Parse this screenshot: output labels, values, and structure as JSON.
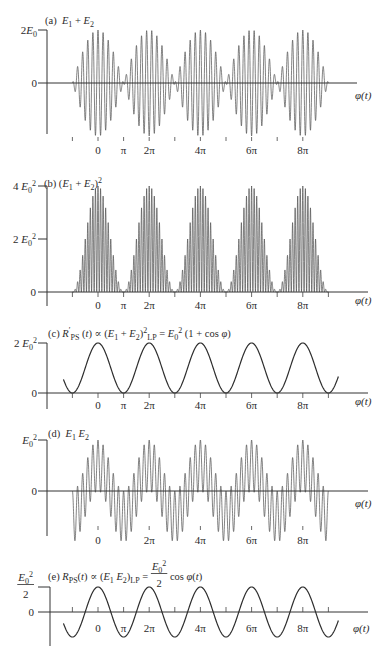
{
  "chart_data": [
    {
      "id": "a",
      "type": "line",
      "title": [
        {
          "text": "(a)  "
        },
        {
          "text": "E",
          "math": true
        },
        {
          "text": "1",
          "sub": true
        },
        {
          "text": " + "
        },
        {
          "text": "E",
          "math": true
        },
        {
          "text": "2",
          "sub": true
        }
      ],
      "xlabel": "φ(t)",
      "x_unit": "π rad",
      "y_unit": "E₀",
      "xlim": [
        -2,
        10.1
      ],
      "ylim": [
        -2,
        2
      ],
      "y_ticks": [
        {
          "value": 2,
          "label": [
            {
              "text": "2"
            },
            {
              "text": "E",
              "math": true
            },
            {
              "text": "0",
              "sub": true
            }
          ]
        },
        {
          "value": 0,
          "label": [
            {
              "text": "0"
            }
          ]
        }
      ],
      "x_tick_marks": [
        -1,
        0,
        1,
        2,
        3,
        4,
        5,
        6,
        7,
        8
      ],
      "x_tick_labels": [
        {
          "value": 0,
          "label": "0"
        },
        {
          "value": 1,
          "label": "π"
        },
        {
          "value": 2,
          "label": "2π"
        },
        {
          "value": 4,
          "label": "4π"
        },
        {
          "value": 6,
          "label": "6π"
        },
        {
          "value": 8,
          "label": "8π"
        }
      ],
      "series": [
        {
          "name": "E1 + E2",
          "model": "beat_sum",
          "amplitude": 2,
          "carrier_cycles_per_2pi": 10,
          "x_range": [
            -1,
            9
          ],
          "envelope_maxima": [
            [
              0,
              2
            ],
            [
              2,
              2
            ],
            [
              4,
              2
            ],
            [
              6,
              2
            ],
            [
              8,
              2
            ]
          ],
          "envelope_zeros": [
            -1,
            1,
            3,
            5,
            7,
            9
          ]
        }
      ]
    },
    {
      "id": "b",
      "type": "line",
      "title": [
        {
          "text": "(b) ("
        },
        {
          "text": "E",
          "math": true
        },
        {
          "text": "1",
          "sub": true
        },
        {
          "text": " + "
        },
        {
          "text": "E",
          "math": true
        },
        {
          "text": "2",
          "sub": true
        },
        {
          "text": ")"
        },
        {
          "text": "2",
          "sup": true
        }
      ],
      "xlabel": "φ(t)",
      "x_unit": "π rad",
      "y_unit": "E₀²",
      "xlim": [
        -2,
        10.5
      ],
      "ylim": [
        0,
        4
      ],
      "y_ticks": [
        {
          "value": 4,
          "label": [
            {
              "text": "4 "
            },
            {
              "text": "E",
              "math": true
            },
            {
              "text": "0",
              "sub": true
            },
            {
              "text": "2",
              "sup": true
            }
          ]
        },
        {
          "value": 2,
          "label": [
            {
              "text": "2 "
            },
            {
              "text": "E",
              "math": true
            },
            {
              "text": "0",
              "sub": true
            },
            {
              "text": "2",
              "sup": true
            }
          ]
        },
        {
          "value": 0,
          "label": [
            {
              "text": "0"
            }
          ]
        }
      ],
      "x_tick_marks": [
        -1,
        0,
        1,
        2,
        3,
        4,
        5,
        6,
        7,
        8,
        9
      ],
      "x_tick_labels": [
        {
          "value": 0,
          "label": "0"
        },
        {
          "value": 1,
          "label": "π"
        },
        {
          "value": 2,
          "label": "2π"
        },
        {
          "value": 4,
          "label": "4π"
        },
        {
          "value": 6,
          "label": "6π"
        },
        {
          "value": 8,
          "label": "8π"
        }
      ],
      "series": [
        {
          "name": "(E1 + E2)^2",
          "model": "beat_sum_squared",
          "amplitude": 4,
          "carrier_cycles_per_2pi": 10,
          "x_range": [
            -1,
            9
          ],
          "peaks": [
            [
              0,
              4
            ],
            [
              2,
              4
            ],
            [
              4,
              4
            ],
            [
              6,
              4
            ],
            [
              8,
              4
            ]
          ],
          "zeros": [
            -1,
            1,
            3,
            5,
            7,
            9
          ]
        }
      ]
    },
    {
      "id": "c",
      "type": "line",
      "title": [
        {
          "text": "(c) "
        },
        {
          "text": "R",
          "math": true
        },
        {
          "text": "′",
          "sup": true
        },
        {
          "text": "PS",
          "sub": true
        },
        {
          "text": " ("
        },
        {
          "text": "t",
          "math": true
        },
        {
          "text": ") ∝ ("
        },
        {
          "text": "E",
          "math": true
        },
        {
          "text": "1",
          "sub": true
        },
        {
          "text": " + "
        },
        {
          "text": "E",
          "math": true
        },
        {
          "text": "2",
          "sub": true
        },
        {
          "text": ")"
        },
        {
          "text": "2",
          "sup": true
        },
        {
          "text": "LP",
          "sub": true
        },
        {
          "text": " = "
        },
        {
          "text": "E",
          "math": true
        },
        {
          "text": "0",
          "sub": true
        },
        {
          "text": "2",
          "sup": true
        },
        {
          "text": " (1 + cos "
        },
        {
          "text": "φ",
          "math": true
        },
        {
          "text": ")"
        }
      ],
      "xlabel": "φ(t)",
      "x_unit": "π rad",
      "y_unit": "E₀²",
      "xlim": [
        -2,
        10.5
      ],
      "ylim": [
        0,
        2
      ],
      "y_ticks": [
        {
          "value": 2,
          "label": [
            {
              "text": "2 "
            },
            {
              "text": "E",
              "math": true
            },
            {
              "text": "0",
              "sub": true
            },
            {
              "text": "2",
              "sup": true
            }
          ]
        },
        {
          "value": 0,
          "label": [
            {
              "text": "0"
            }
          ]
        }
      ],
      "x_tick_marks": [
        -1,
        0,
        1,
        2,
        3,
        4,
        5,
        6,
        7,
        8,
        9
      ],
      "x_tick_labels": [
        {
          "value": 0,
          "label": "0"
        },
        {
          "value": 1,
          "label": "π"
        },
        {
          "value": 2,
          "label": "2π"
        },
        {
          "value": 4,
          "label": "4π"
        },
        {
          "value": 6,
          "label": "6π"
        },
        {
          "value": 8,
          "label": "8π"
        }
      ],
      "series": [
        {
          "name": "R'PS(t)",
          "model": "one_plus_cos",
          "amplitude": 1,
          "x_range": [
            -1.35,
            9.4
          ],
          "points": [
            [
              -1,
              0
            ],
            [
              0,
              2
            ],
            [
              1,
              0
            ],
            [
              2,
              2
            ],
            [
              3,
              0
            ],
            [
              4,
              2
            ],
            [
              5,
              0
            ],
            [
              6,
              2
            ],
            [
              7,
              0
            ],
            [
              8,
              2
            ],
            [
              9,
              0
            ]
          ]
        }
      ]
    },
    {
      "id": "d",
      "type": "line",
      "title": [
        {
          "text": "(d)  "
        },
        {
          "text": "E",
          "math": true
        },
        {
          "text": "1",
          "sub": true
        },
        {
          "text": " "
        },
        {
          "text": "E",
          "math": true
        },
        {
          "text": "2",
          "sub": true
        }
      ],
      "xlabel": "φ(t)",
      "x_unit": "π rad",
      "y_unit": "E₀²",
      "xlim": [
        -2,
        10.5
      ],
      "ylim": [
        -1,
        1
      ],
      "y_ticks": [
        {
          "value": 1,
          "label": [
            {
              "text": "E",
              "math": true
            },
            {
              "text": "0",
              "sub": true
            },
            {
              "text": "2",
              "sup": true
            }
          ]
        },
        {
          "value": 0,
          "label": [
            {
              "text": "0"
            }
          ]
        }
      ],
      "x_tick_marks": [
        0,
        2,
        4,
        6,
        8
      ],
      "x_tick_labels": [
        {
          "value": 0,
          "label": "0"
        },
        {
          "value": 2,
          "label": "2π"
        },
        {
          "value": 4,
          "label": "4π"
        },
        {
          "value": 6,
          "label": "6π"
        },
        {
          "value": 8,
          "label": "8π"
        }
      ],
      "series": [
        {
          "name": "E1 E2",
          "model": "product",
          "amplitude": 0.5,
          "carrier_cycles_per_2pi": 10,
          "x_range": [
            -1,
            9
          ],
          "upper_peaks": [
            [
              0,
              1
            ],
            [
              2,
              1
            ],
            [
              4,
              1
            ],
            [
              6,
              1
            ],
            [
              8,
              1
            ]
          ],
          "lower_troughs": [
            [
              1,
              -1
            ],
            [
              3,
              -1
            ],
            [
              5,
              -1
            ],
            [
              7,
              -1
            ]
          ]
        }
      ]
    },
    {
      "id": "e",
      "type": "line",
      "title": [
        {
          "text": "(e) "
        },
        {
          "text": "R",
          "math": true
        },
        {
          "text": "PS",
          "sub": true
        },
        {
          "text": "("
        },
        {
          "text": "t",
          "math": true
        },
        {
          "text": ") ∝ ("
        },
        {
          "text": "E",
          "math": true
        },
        {
          "text": "1",
          "sub": true
        },
        {
          "text": " "
        },
        {
          "text": "E",
          "math": true
        },
        {
          "text": "2",
          "sub": true
        },
        {
          "text": ")"
        },
        {
          "text": "LP",
          "sub": true
        },
        {
          "text": " = "
        },
        {
          "frac": {
            "num": [
              {
                "text": "E",
                "math": true
              },
              {
                "text": "0",
                "sub": true
              },
              {
                "text": "2",
                "sup": true
              }
            ],
            "den": [
              {
                "text": "2"
              }
            ]
          }
        },
        {
          "text": " cos "
        },
        {
          "text": "φ",
          "math": true
        },
        {
          "text": "("
        },
        {
          "text": "t",
          "math": true
        },
        {
          "text": ")"
        }
      ],
      "xlabel": "φ(t)",
      "x_unit": "π rad",
      "y_unit": "E₀²",
      "xlim": [
        -1.9,
        10.5
      ],
      "ylim": [
        -0.5,
        0.5
      ],
      "y_ticks": [
        {
          "value": 0.5,
          "label": [
            {
              "frac": {
                "num": [
                  {
                    "text": "E",
                    "math": true
                  },
                  {
                    "text": "0",
                    "sub": true
                  },
                  {
                    "text": "2",
                    "sup": true
                  }
                ],
                "den": [
                  {
                    "text": "2"
                  }
                ]
              }
            }
          ]
        },
        {
          "value": 0,
          "label": [
            {
              "text": "0"
            }
          ]
        }
      ],
      "x_tick_marks": [
        -1,
        0,
        1,
        2,
        3,
        4,
        5,
        6,
        7,
        8,
        9
      ],
      "x_tick_labels": [
        {
          "value": 0,
          "label": "0"
        },
        {
          "value": 1,
          "label": "π"
        },
        {
          "value": 2,
          "label": "2π"
        },
        {
          "value": 4,
          "label": "4π"
        },
        {
          "value": 6,
          "label": "6π"
        },
        {
          "value": 8,
          "label": "8π"
        }
      ],
      "series": [
        {
          "name": "RPS(t)",
          "model": "cosine",
          "amplitude": 0.5,
          "x_range": [
            -1.35,
            9.4
          ],
          "points": [
            [
              -1,
              -0.5
            ],
            [
              0,
              0.5
            ],
            [
              1,
              -0.5
            ],
            [
              2,
              0.5
            ],
            [
              3,
              -0.5
            ],
            [
              4,
              0.5
            ],
            [
              5,
              -0.5
            ],
            [
              6,
              0.5
            ],
            [
              7,
              -0.5
            ],
            [
              8,
              0.5
            ],
            [
              9,
              -0.5
            ]
          ]
        }
      ]
    }
  ]
}
